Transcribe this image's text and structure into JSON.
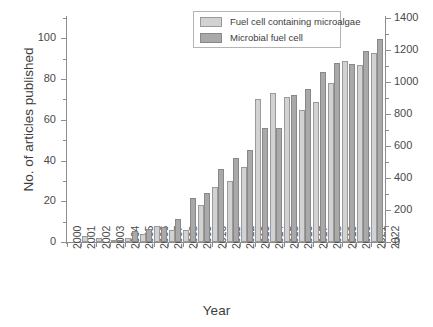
{
  "chart_data": {
    "type": "bar",
    "title": "",
    "xlabel": "Year",
    "ylabel": "No. of articles published",
    "ylabel_right": "",
    "categories": [
      "2000",
      "2001",
      "2002",
      "2003",
      "2004",
      "2005",
      "2006",
      "2007",
      "2008",
      "2009",
      "2010",
      "2011",
      "2012",
      "2013",
      "2014",
      "2015",
      "2016",
      "2017",
      "2018",
      "2019",
      "2020",
      "2021"
    ],
    "series": [
      {
        "name": "Fuel cell containing microalgae",
        "axis": "left",
        "color": "#d2d2d2",
        "values": [
          0,
          3,
          2,
          1,
          2,
          4,
          8,
          6,
          6,
          18,
          27,
          30,
          37,
          70,
          73,
          71,
          65,
          69,
          78,
          89,
          87,
          93
        ]
      },
      {
        "name": "Microbial fuel cell",
        "axis": "right",
        "color": "#a9a9a9",
        "values": [
          0,
          0,
          0,
          12,
          69,
          81,
          94,
          144,
          272,
          307,
          455,
          522,
          573,
          714,
          714,
          919,
          956,
          1065,
          1118,
          1112,
          1194,
          1270
        ]
      }
    ],
    "xlim": [
      2000,
      2022
    ],
    "ylim_left": [
      0,
      110
    ],
    "ylim_right": [
      0,
      1400
    ],
    "yticks_left": [
      0,
      20,
      40,
      60,
      80,
      100
    ],
    "yticks_right": [
      0,
      200,
      400,
      600,
      800,
      1000,
      1200,
      1400
    ],
    "xticks": [
      "2000",
      "2001",
      "2002",
      "2003",
      "2004",
      "2005",
      "2006",
      "2007",
      "2008",
      "2009",
      "2010",
      "2011",
      "2012",
      "2013",
      "2014",
      "2015",
      "2016",
      "2017",
      "2018",
      "2019",
      "2020",
      "2021",
      "2022"
    ],
    "grid": false,
    "legend_position": "top-center",
    "legend": [
      "Fuel cell containing microalgae",
      "Microbial fuel cell"
    ]
  },
  "legend": {
    "items": [
      {
        "label": "Fuel cell containing microalgae"
      },
      {
        "label": "Microbial fuel cell"
      }
    ]
  },
  "axes": {
    "x_title": "Year",
    "y_title_left": "No. of articles published"
  }
}
